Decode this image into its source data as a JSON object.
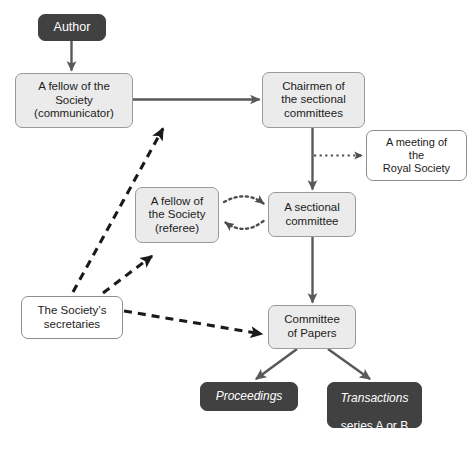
{
  "diagram": {
    "colors": {
      "dark_box_fill": "#414141",
      "dark_box_text": "#ffffff",
      "light_box_fill": "#ebebeb",
      "light_box_stroke": "#9a9a9a",
      "white_box_fill": "#ffffff",
      "edge_solid": "#595959",
      "edge_dashed": "#1a1a1a",
      "edge_dotted": "#4d4d4d",
      "background": "#ffffff"
    },
    "nodes": [
      {
        "id": "author",
        "label": "Author",
        "style": "dark",
        "x": 38,
        "y": 14,
        "w": 68,
        "h": 27,
        "font_size": 12.5
      },
      {
        "id": "communicator",
        "label": "A fellow of the\nSociety\n(communicator)",
        "style": "light",
        "x": 15,
        "y": 73,
        "w": 118,
        "h": 55,
        "font_size": 11.5
      },
      {
        "id": "chairmen",
        "label": "Chairmen of\nthe sectional\ncommittees",
        "style": "light",
        "x": 262,
        "y": 72,
        "w": 103,
        "h": 56,
        "font_size": 11.5
      },
      {
        "id": "meeting",
        "label": "A meeting of\nthe\nRoyal Society",
        "style": "white",
        "x": 366,
        "y": 130,
        "w": 101,
        "h": 51,
        "font_size": 11
      },
      {
        "id": "referee",
        "label": "A fellow of\nthe Society\n(referee)",
        "style": "light",
        "x": 135,
        "y": 187,
        "w": 84,
        "h": 56,
        "font_size": 11.5
      },
      {
        "id": "sectional_committee",
        "label": "A sectional\ncommittee",
        "style": "light",
        "x": 268,
        "y": 192,
        "w": 88,
        "h": 45,
        "font_size": 11.5
      },
      {
        "id": "secretaries",
        "label": "The Society’s\nsecretaries",
        "style": "white",
        "x": 21,
        "y": 296,
        "w": 102,
        "h": 43,
        "font_size": 11.5
      },
      {
        "id": "committee_of_papers",
        "label": "Committee\nof Papers",
        "style": "light",
        "x": 268,
        "y": 305,
        "w": 88,
        "h": 44,
        "font_size": 11.5
      },
      {
        "id": "proceedings",
        "label": "Proceedings",
        "style": "dark",
        "italic": true,
        "x": 200,
        "y": 382,
        "w": 98,
        "h": 29,
        "font_size": 12
      },
      {
        "id": "transactions",
        "label": "Transactions\nseries A or B",
        "label_line1": "Transactions",
        "label_line2": "series A or B",
        "style": "dark",
        "x": 327,
        "y": 382,
        "w": 95,
        "h": 46,
        "font_size": 12
      }
    ],
    "edges": [
      {
        "id": "author-to-communicator",
        "from": "author",
        "to": "communicator",
        "kind": "solid"
      },
      {
        "id": "communicator-to-chairmen",
        "from": "communicator",
        "to": "chairmen",
        "kind": "solid"
      },
      {
        "id": "chairmen-to-sectional-committee",
        "from": "chairmen",
        "to": "sectional_committee",
        "kind": "solid"
      },
      {
        "id": "chairmen-to-meeting",
        "from": "chairmen",
        "to": "meeting",
        "kind": "dotted"
      },
      {
        "id": "referee-to-sectional-committee",
        "from": "referee",
        "to": "sectional_committee",
        "kind": "dotted-curved"
      },
      {
        "id": "sectional-committee-to-referee",
        "from": "sectional_committee",
        "to": "referee",
        "kind": "dotted-curved"
      },
      {
        "id": "sectional-committee-to-committee-of-papers",
        "from": "sectional_committee",
        "to": "committee_of_papers",
        "kind": "solid"
      },
      {
        "id": "secretaries-to-communicator",
        "from": "secretaries",
        "to": "communicator",
        "kind": "dashed"
      },
      {
        "id": "secretaries-to-referee",
        "from": "secretaries",
        "to": "referee",
        "kind": "dashed"
      },
      {
        "id": "secretaries-to-committee-of-papers",
        "from": "secretaries",
        "to": "committee_of_papers",
        "kind": "dashed"
      },
      {
        "id": "committee-of-papers-to-proceedings",
        "from": "committee_of_papers",
        "to": "proceedings",
        "kind": "solid"
      },
      {
        "id": "committee-of-papers-to-transactions",
        "from": "committee_of_papers",
        "to": "transactions",
        "kind": "solid"
      }
    ]
  }
}
